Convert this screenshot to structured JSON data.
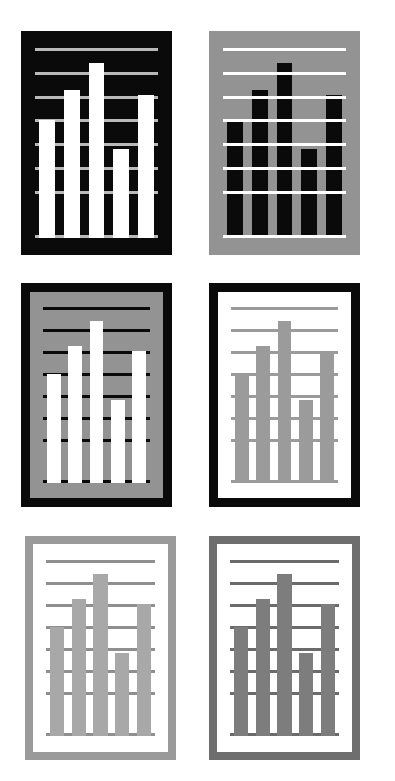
{
  "figure": {
    "layout": {
      "rows": 3,
      "columns": 2,
      "count": 6
    },
    "canvas": {
      "width": 395,
      "height": 781,
      "background": "#ffffff"
    }
  },
  "chart_data": {
    "type": "bar",
    "xlabel": "",
    "ylabel": "",
    "categories": [
      "1",
      "2",
      "3",
      "4",
      "5"
    ],
    "values": [
      62,
      78,
      92,
      47,
      75
    ],
    "ylim": [
      0,
      100
    ],
    "grid": true,
    "gridline_count": 8,
    "gridline_values": [
      100,
      87.5,
      75,
      62.5,
      50,
      37.5,
      25,
      0
    ],
    "legend": "none",
    "legend_position": "none",
    "bar_count": 5,
    "bar_width_pct": 13,
    "bar_gap_pct": 5.5,
    "series": [
      {
        "name": "values",
        "values": [
          62,
          78,
          92,
          47,
          75
        ]
      }
    ]
  },
  "palette": {
    "black": "#0a0a0a",
    "white": "#ffffff",
    "grey_mid": "#939393",
    "grey_light": "#b5b5b5",
    "grey_bar": "#9b9b9b",
    "grey_dark": "#717171",
    "grey_border_light": "#9a9a9a",
    "grey_border_dark": "#6e6e6e",
    "grid_on_black": "#b9b9b9"
  },
  "panels": [
    {
      "id": "panel-1",
      "name": "black-card-white-bars",
      "position": "top-left",
      "border_color": "#0a0a0a",
      "border_width": 0,
      "background_color": "#0a0a0a",
      "bar_color": "#ffffff",
      "gridline_color": "#b9b9b9",
      "gridline_over_bars": false,
      "rect": {
        "x": 21,
        "y": 31,
        "width": 151,
        "height": 224
      }
    },
    {
      "id": "panel-2",
      "name": "grey-card-black-bars",
      "position": "top-right",
      "border_color": "#939393",
      "border_width": 0,
      "background_color": "#939393",
      "bar_color": "#0a0a0a",
      "gridline_color": "#ffffff",
      "gridline_over_bars": true,
      "rect": {
        "x": 209,
        "y": 31,
        "width": 151,
        "height": 224
      }
    },
    {
      "id": "panel-3",
      "name": "black-border-grey-card-white-bars",
      "position": "middle-left",
      "border_color": "#0a0a0a",
      "border_width": 9,
      "background_color": "#939393",
      "bar_color": "#ffffff",
      "gridline_color": "#0a0a0a",
      "gridline_over_bars": false,
      "rect": {
        "x": 21,
        "y": 283,
        "width": 151,
        "height": 224
      }
    },
    {
      "id": "panel-4",
      "name": "black-border-white-card-grey-bars",
      "position": "middle-right",
      "border_color": "#0a0a0a",
      "border_width": 9,
      "background_color": "#ffffff",
      "bar_color": "#9b9b9b",
      "gridline_color": "#9b9b9b",
      "gridline_over_bars": false,
      "rect": {
        "x": 209,
        "y": 283,
        "width": 151,
        "height": 224
      }
    },
    {
      "id": "panel-5",
      "name": "light-grey-border-white-card-grey-bars",
      "position": "bottom-left",
      "border_color": "#9a9a9a",
      "border_width": 8,
      "background_color": "#ffffff",
      "bar_color": "#a8a8a8",
      "gridline_color": "#8f8f8f",
      "gridline_over_bars": false,
      "rect": {
        "x": 25,
        "y": 536,
        "width": 151,
        "height": 224
      }
    },
    {
      "id": "panel-6",
      "name": "dark-grey-border-white-card-grey-bars",
      "position": "bottom-right",
      "border_color": "#6e6e6e",
      "border_width": 8,
      "background_color": "#ffffff",
      "bar_color": "#7d7d7d",
      "gridline_color": "#6b6b6b",
      "gridline_over_bars": false,
      "rect": {
        "x": 209,
        "y": 536,
        "width": 151,
        "height": 224
      }
    }
  ]
}
